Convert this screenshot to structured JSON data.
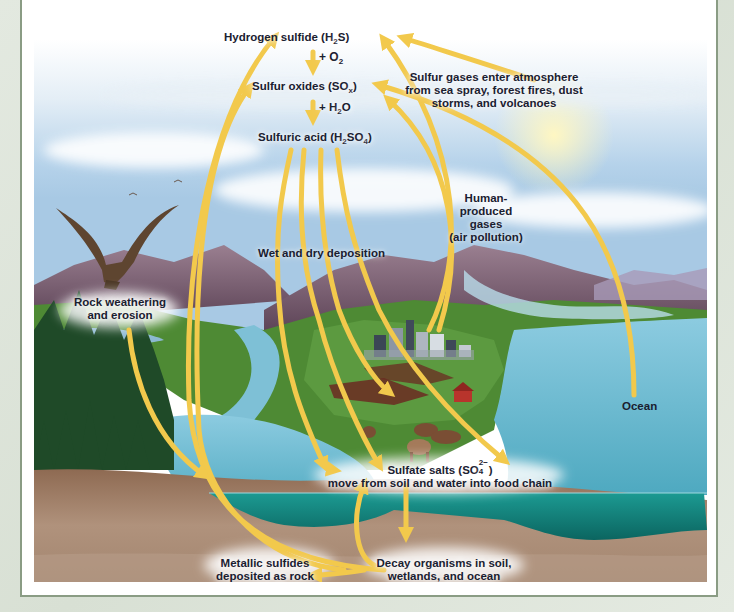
{
  "colors": {
    "arrow": "#f2c94c",
    "sky_top": "#ffffff",
    "sky_mid": "#bcd6ea",
    "ocean": "#5fb2c4",
    "deep_water": "#157f7a",
    "soil": "#9b7a62",
    "mountain": "#7d5f73",
    "grass": "#4e8a34",
    "frame_border": "#8a9c84",
    "text": "#1a2030"
  },
  "atmosphere": {
    "hydrogen_sulfide": {
      "text": "Hydrogen sulfide (H",
      "sub": "2",
      "tail": "S)"
    },
    "plus_o2": {
      "text": "+ O",
      "sub": "2"
    },
    "sulfur_oxides": {
      "text": "Sulfur oxides (SO",
      "sub": "x",
      "tail": ")"
    },
    "plus_h2o": {
      "text": "+ H",
      "sub": "2",
      "tail": "O"
    },
    "sulfuric_acid": {
      "text": "Sulfuric acid (H",
      "sub1": "2",
      "mid": "SO",
      "sub2": "4",
      "tail": ")"
    }
  },
  "labels": {
    "sources": [
      "Sulfur gases enter atmosphere",
      "from sea spray, forest fires, dust",
      "storms, and volcanoes"
    ],
    "human": [
      "Human-",
      "produced",
      "gases",
      "(air pollution)"
    ],
    "deposition": "Wet and dry deposition",
    "weathering": [
      "Rock weathering",
      "and erosion"
    ],
    "ocean": "Ocean",
    "sulfate": {
      "line1_text": "Sulfate salts (SO",
      "sub": "4",
      "sup": "2−",
      "line1_tail": ")",
      "line2": "move from soil and water into food chain"
    },
    "metallic": [
      "Metallic sulfides",
      "deposited as rock"
    ],
    "decay": [
      "Decay organisms in soil,",
      "wetlands, and ocean"
    ]
  },
  "icons": {
    "eagle": "eagle-icon",
    "city": "city-icon",
    "barn": "barn-icon",
    "cows": "cow-icon"
  }
}
